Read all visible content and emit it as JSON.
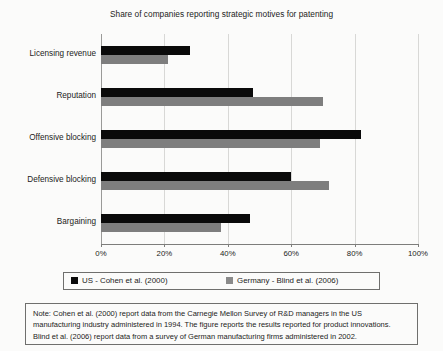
{
  "chart_data": {
    "type": "bar",
    "orientation": "horizontal",
    "title": "Share of companies reporting strategic motives for patenting",
    "xlabel": "",
    "ylabel": "",
    "xlim": [
      0,
      100
    ],
    "grid": true,
    "legend_position": "bottom",
    "categories": [
      "Licensing revenue",
      "Reputation",
      "Offensive blocking",
      "Defensive blocking",
      "Bargaining"
    ],
    "tick_labels": [
      "0%",
      "20%",
      "40%",
      "60%",
      "80%",
      "100%"
    ],
    "tick_values": [
      0,
      20,
      40,
      60,
      80,
      100
    ],
    "series": [
      {
        "name": "US - Cohen et al. (2000)",
        "color": "#0a0a0a",
        "values": [
          28,
          48,
          82,
          60,
          47
        ]
      },
      {
        "name": "Germany - Blind et al. (2006)",
        "color": "#7e7e7e",
        "values": [
          21,
          70,
          69,
          72,
          38
        ]
      }
    ]
  },
  "note": {
    "lines": [
      "Note: Cohen et al. (2000) report data from the Carnegie Mellon Survey of R&D managers in the US",
      "manufacturing industry administered in 1994. The figure reports the results reported for product innovations.",
      "Blind et al. (2006) report data from a survey of German manufacturing firms administered in 2002."
    ]
  }
}
